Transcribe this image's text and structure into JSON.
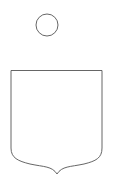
{
  "figure": {
    "stroke_color": "#555555",
    "background": "#ffffff",
    "shapes": [
      {
        "name": "circle",
        "cx": 47,
        "cy": 25,
        "r": 11
      },
      {
        "name": "shield",
        "left": 11,
        "right": 102,
        "top": 70.5,
        "side_bottom": 150,
        "point_x": 57,
        "point_y": 174
      }
    ]
  }
}
